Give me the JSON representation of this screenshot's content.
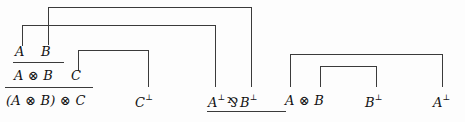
{
  "figure": {
    "kind": "proof-net-derivation",
    "background_color": "#fdfdfd",
    "line_color": "#3b3b3b",
    "text_color": "#111111"
  },
  "terms": {
    "a_top": "A",
    "b_top": "B",
    "a_tensor_b": "A ⊗ B",
    "c": "C",
    "a_tensor_b_tensor_c": "(A ⊗ B) ⊗ C",
    "c_perp": "C",
    "c_perp_sup": "⊥",
    "a_perp_par_b_perp_a": "A",
    "a_perp_par_b_perp_a_sup": "⊥",
    "a_perp_par_b_perp_op": "⅋",
    "a_perp_par_b_perp_b": "B",
    "a_perp_par_b_perp_b_sup": "⊥",
    "a_tensor_b_right": "A ⊗ B",
    "b_perp_right": "B",
    "b_perp_right_sup": "⊥",
    "a_perp_right": "A",
    "a_perp_right_sup": "⊥"
  },
  "links": {
    "axiom_outer_a": "axiom-link-A-Aperp",
    "axiom_inner_b": "axiom-link-B-Bperp",
    "axiom_c": "axiom-link-C-Cperp",
    "axiom_right_outer": "axiom-link-AtensorB-Aperp",
    "axiom_right_inner": "axiom-link-AtensorB-Bperp"
  }
}
